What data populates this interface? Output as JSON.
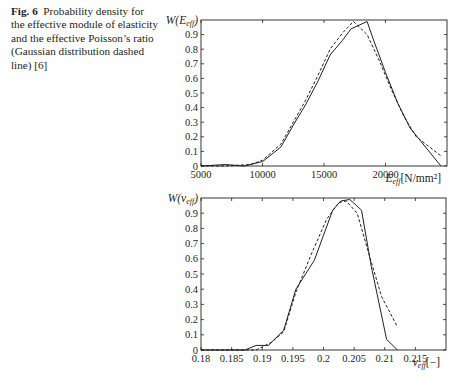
{
  "caption": {
    "label": "Fig. 6",
    "text": "Probability density for the effective module of elasticity and the effective Poisson’s ratio (Gaussian distribution dashed line) [6]"
  },
  "chart_data": [
    {
      "type": "line",
      "title": "",
      "ylabel": "W(E_eff)",
      "xlabel": "E_eff [N/mm²]",
      "xlim": [
        5000,
        25000
      ],
      "ylim": [
        0,
        1
      ],
      "x_ticks": [
        "5000",
        "10000",
        "15000",
        "20000"
      ],
      "y_ticks": [
        "0",
        "0.1",
        "0.2",
        "0.3",
        "0.4",
        "0.5",
        "0.6",
        "0.7",
        "0.8",
        "0.9"
      ],
      "grid": false,
      "series": [
        {
          "name": "Probability density (simulation)",
          "style": "solid",
          "x": [
            5000,
            7000,
            8500,
            10000,
            11500,
            12500,
            13500,
            14500,
            15500,
            16500,
            17200,
            18500,
            19000,
            20000,
            21000,
            22000,
            24500
          ],
          "y": [
            0.0,
            0.01,
            0.0,
            0.03,
            0.13,
            0.28,
            0.42,
            0.58,
            0.76,
            0.86,
            0.94,
            0.99,
            0.87,
            0.64,
            0.43,
            0.26,
            0.0
          ]
        },
        {
          "name": "Gaussian distribution",
          "style": "dashed",
          "x": [
            5000,
            7000,
            9000,
            10000,
            11500,
            12500,
            13500,
            14500,
            15500,
            16500,
            17400,
            18500,
            19500,
            20500,
            21500,
            22500,
            24500
          ],
          "y": [
            0.0,
            0.0,
            0.01,
            0.04,
            0.15,
            0.3,
            0.45,
            0.62,
            0.8,
            0.91,
            0.99,
            0.9,
            0.72,
            0.52,
            0.34,
            0.2,
            0.07
          ]
        }
      ]
    },
    {
      "type": "line",
      "title": "",
      "ylabel": "W(ν_eff)",
      "xlabel": "ν_eff [−]",
      "xlim": [
        0.18,
        0.22
      ],
      "ylim": [
        0,
        1
      ],
      "x_ticks": [
        "0.18",
        "0.185",
        "0.19",
        "0.195",
        "0.2",
        "0.205",
        "0.21",
        "0.215"
      ],
      "y_ticks": [
        "0",
        "0.1",
        "0.2",
        "0.3",
        "0.4",
        "0.5",
        "0.6",
        "0.7",
        "0.8",
        "0.9"
      ],
      "grid": false,
      "series": [
        {
          "name": "Probability density (simulation)",
          "style": "solid",
          "x": [
            0.18,
            0.1855,
            0.1872,
            0.189,
            0.191,
            0.1935,
            0.1955,
            0.1985,
            0.2015,
            0.2028,
            0.2043,
            0.2062,
            0.2078,
            0.2103,
            0.2121
          ],
          "y": [
            0.0,
            0.0,
            0.0,
            0.03,
            0.03,
            0.13,
            0.4,
            0.59,
            0.92,
            0.98,
            0.99,
            0.92,
            0.55,
            0.07,
            0.0
          ]
        },
        {
          "name": "Gaussian distribution",
          "style": "dashed",
          "x": [
            0.18,
            0.1865,
            0.189,
            0.1915,
            0.1935,
            0.1955,
            0.198,
            0.2005,
            0.2025,
            0.2037,
            0.2055,
            0.2075,
            0.2095,
            0.2121
          ],
          "y": [
            0.0,
            0.0,
            0.0,
            0.05,
            0.12,
            0.38,
            0.63,
            0.86,
            0.97,
            0.98,
            0.9,
            0.62,
            0.35,
            0.15
          ]
        }
      ]
    }
  ]
}
